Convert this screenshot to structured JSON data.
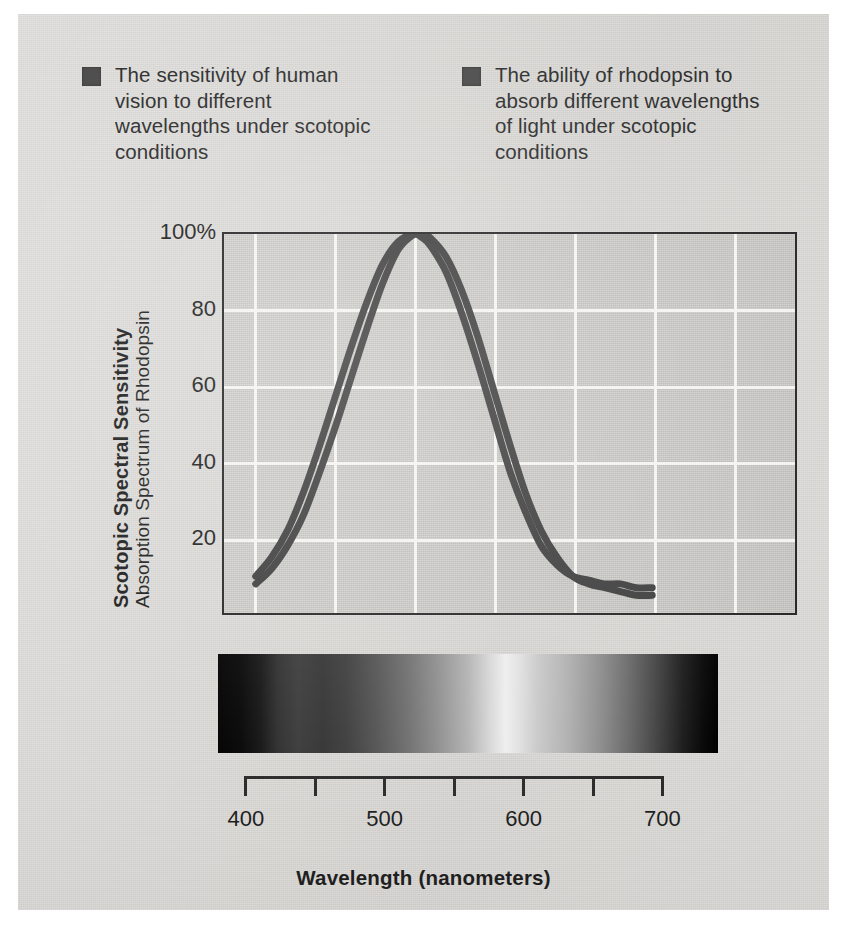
{
  "legend": {
    "entries": [
      {
        "swatch_color": "#4a4a4a",
        "label": "The sensitivity of human vision to different wavelengths under scotopic conditions"
      },
      {
        "swatch_color": "#4a4a4a",
        "label": "The ability of rhodopsin to absorb different wavelengths of light under scotopic conditions"
      }
    ]
  },
  "axes": {
    "y_title_primary": "Scotopic Spectral Sensitivity",
    "y_title_secondary": "Absorption Spectrum of Rhodopsin",
    "x_title": "Wavelength (nanometers)",
    "y_tick_labels": [
      "100%",
      "80",
      "60",
      "40",
      "20"
    ],
    "x_tick_labels": [
      "400",
      "500",
      "600",
      "700"
    ]
  },
  "spectrum": {
    "name": "visible-spectrum-grayscale-bar",
    "start_nm": 380,
    "end_nm": 740
  },
  "chart_data": {
    "type": "line",
    "xlabel": "Wavelength (nanometers)",
    "ylabel": "Scotopic Spectral Sensitivity / Absorption Spectrum of Rhodopsin",
    "xlim": [
      380,
      740
    ],
    "ylim": [
      0,
      100
    ],
    "xticks": [
      400,
      450,
      500,
      550,
      600,
      650,
      700
    ],
    "xticklabels": [
      "400",
      "",
      "500",
      "",
      "600",
      "",
      "700"
    ],
    "yticks": [
      20,
      40,
      60,
      80,
      100
    ],
    "yticklabels": [
      "20",
      "40",
      "60",
      "80",
      "100%"
    ],
    "grid": true,
    "grid_color": "#f4f3f1",
    "legend_position": "above-plot",
    "line_color": "#3f3f3f",
    "line_width_px": 7,
    "series": [
      {
        "name": "The sensitivity of human vision to different wavelengths under scotopic conditions",
        "color": "#3f3f3f",
        "peak_nm": 505,
        "x": [
          400,
          410,
          420,
          430,
          440,
          450,
          460,
          470,
          480,
          490,
          500,
          505,
          510,
          520,
          530,
          540,
          550,
          560,
          570,
          580,
          590,
          600,
          610,
          620,
          630,
          640,
          650
        ],
        "y": [
          8,
          12,
          18,
          26,
          37,
          49,
          62,
          75,
          87,
          96,
          100,
          100,
          99,
          94,
          85,
          73,
          59,
          45,
          32,
          22,
          15,
          10,
          8,
          7,
          6,
          5,
          5
        ]
      },
      {
        "name": "The ability of rhodopsin to absorb different wavelengths of light under scotopic conditions",
        "color": "#3f3f3f",
        "peak_nm": 500,
        "x": [
          400,
          410,
          420,
          430,
          440,
          450,
          460,
          470,
          480,
          490,
          500,
          505,
          510,
          520,
          530,
          540,
          550,
          560,
          570,
          580,
          590,
          600,
          610,
          620,
          630,
          640,
          650
        ],
        "y": [
          10,
          15,
          22,
          32,
          44,
          57,
          70,
          82,
          92,
          98,
          100,
          99,
          97,
          90,
          79,
          66,
          52,
          38,
          27,
          18,
          13,
          10,
          9,
          8,
          8,
          7,
          7
        ]
      }
    ]
  }
}
